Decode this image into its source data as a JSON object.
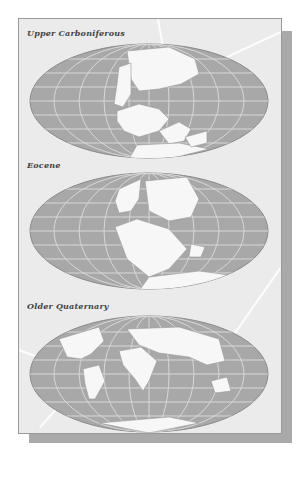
{
  "figure": {
    "panels": [
      {
        "label": "Upper Carboniferous",
        "icon": "world-map-pangaea-icon"
      },
      {
        "label": "Eocene",
        "icon": "world-map-eocene-icon"
      },
      {
        "label": "Older Quaternary",
        "icon": "world-map-modern-icon"
      }
    ],
    "colors": {
      "background": "#ffffff",
      "card": "#ebebeb",
      "ocean": "#a8a8a8",
      "grid": "#d8d8d8",
      "land": "#f7f7f7",
      "shadow": "#a9a9a9",
      "label": "#444444"
    }
  }
}
